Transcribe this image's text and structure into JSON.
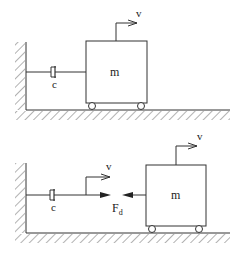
{
  "diagram": {
    "top": {
      "mass_label": "m",
      "damper_label": "c",
      "velocity_label": "v"
    },
    "bottom": {
      "mass_label": "m",
      "damper_label": "c",
      "velocity_label_damper": "v",
      "velocity_label_mass": "v",
      "force_label": "F",
      "force_subscript": "d"
    }
  },
  "colors": {
    "stroke": "#333333",
    "hatch": "#555555",
    "background": "#ffffff"
  }
}
